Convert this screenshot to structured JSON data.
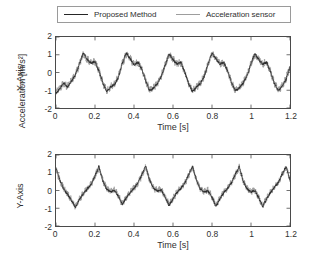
{
  "figure": {
    "outer_ylabel": "Acceleration [m/s²]",
    "legend": {
      "entries": [
        {
          "label": "Proposed Method",
          "color": "#262626",
          "style": "solid"
        },
        {
          "label": "Acceleration sensor",
          "color": "#9d9d9d",
          "style": "solid"
        }
      ]
    }
  },
  "chart_data": [
    {
      "type": "line",
      "title": "",
      "panel": "top",
      "xlabel": "Time [s]",
      "ylabel": "X-Axis",
      "xlim": [
        0,
        1.2
      ],
      "ylim": [
        -2,
        2
      ],
      "xticks": [
        0,
        0.2,
        0.4,
        0.6,
        0.8,
        1,
        1.2
      ],
      "xticklabels": [
        "0",
        "0.2",
        "0.4",
        "0.6",
        "0.8",
        "1",
        "1.2"
      ],
      "yticks": [
        -2,
        -1,
        0,
        1,
        2
      ],
      "yticklabels": [
        "-2",
        "-1",
        "0",
        "1",
        "2"
      ],
      "grid": false,
      "legend_position": "above-figure",
      "period": 0.222,
      "series": [
        {
          "name": "Acceleration sensor",
          "color": "#9d9d9d",
          "noise": 0.18,
          "x": [
            0,
            0.02,
            0.04,
            0.06,
            0.08,
            0.1,
            0.12,
            0.14,
            0.16,
            0.18,
            0.2,
            0.22,
            0.24,
            0.26,
            0.28,
            0.3,
            0.32,
            0.34,
            0.36,
            0.38,
            0.4,
            0.42,
            0.44,
            0.46,
            0.48,
            0.5,
            0.52,
            0.54,
            0.56,
            0.58,
            0.6,
            0.62,
            0.64,
            0.66,
            0.68,
            0.7,
            0.72,
            0.74,
            0.76,
            0.78,
            0.8,
            0.82,
            0.84,
            0.86,
            0.88,
            0.9,
            0.92,
            0.94,
            0.96,
            0.98,
            1.0,
            1.02,
            1.04,
            1.06,
            1.08,
            1.1,
            1.12,
            1.14,
            1.16,
            1.18,
            1.2
          ],
          "y": [
            -1.15,
            -0.85,
            -0.62,
            -0.8,
            -0.45,
            -0.1,
            0.45,
            1.05,
            0.75,
            0.55,
            0.6,
            0.1,
            -0.55,
            -1.05,
            -0.8,
            -0.65,
            -0.25,
            0.5,
            1.05,
            0.8,
            0.45,
            0.55,
            0.2,
            -0.45,
            -1.0,
            -0.85,
            -0.6,
            -0.2,
            0.4,
            1.0,
            0.75,
            0.5,
            0.55,
            0.05,
            -0.6,
            -1.05,
            -0.8,
            -0.6,
            -0.2,
            0.45,
            1.05,
            0.8,
            0.5,
            0.55,
            0.1,
            -0.55,
            -1.0,
            -0.85,
            -0.55,
            -0.15,
            0.5,
            1.0,
            0.75,
            0.5,
            0.55,
            0.05,
            -0.6,
            -1.0,
            -0.75,
            -0.35,
            0.3
          ]
        },
        {
          "name": "Proposed Method",
          "color": "#262626",
          "noise": 0.05,
          "x": [
            0,
            0.02,
            0.04,
            0.06,
            0.08,
            0.1,
            0.12,
            0.14,
            0.16,
            0.18,
            0.2,
            0.22,
            0.24,
            0.26,
            0.28,
            0.3,
            0.32,
            0.34,
            0.36,
            0.38,
            0.4,
            0.42,
            0.44,
            0.46,
            0.48,
            0.5,
            0.52,
            0.54,
            0.56,
            0.58,
            0.6,
            0.62,
            0.64,
            0.66,
            0.68,
            0.7,
            0.72,
            0.74,
            0.76,
            0.78,
            0.8,
            0.82,
            0.84,
            0.86,
            0.88,
            0.9,
            0.92,
            0.94,
            0.96,
            0.98,
            1.0,
            1.02,
            1.04,
            1.06,
            1.08,
            1.1,
            1.12,
            1.14,
            1.16,
            1.18,
            1.2
          ],
          "y": [
            -1.2,
            -0.88,
            -0.6,
            -0.82,
            -0.48,
            -0.12,
            0.48,
            1.1,
            0.72,
            0.52,
            0.62,
            0.08,
            -0.58,
            -1.08,
            -0.82,
            -0.68,
            -0.28,
            0.52,
            1.1,
            0.78,
            0.42,
            0.58,
            0.18,
            -0.48,
            -1.02,
            -0.88,
            -0.62,
            -0.22,
            0.42,
            1.05,
            0.72,
            0.48,
            0.58,
            0.02,
            -0.62,
            -1.08,
            -0.82,
            -0.62,
            -0.22,
            0.48,
            1.1,
            0.78,
            0.48,
            0.58,
            0.08,
            -0.58,
            -1.02,
            -0.88,
            -0.58,
            -0.18,
            0.52,
            1.05,
            0.72,
            0.48,
            0.58,
            0.02,
            -0.62,
            -1.02,
            -0.78,
            -0.38,
            0.32
          ]
        }
      ]
    },
    {
      "type": "line",
      "title": "",
      "panel": "bottom",
      "xlabel": "Time [s]",
      "ylabel": "Y-Axis",
      "xlim": [
        0,
        1.2
      ],
      "ylim": [
        -2,
        2
      ],
      "xticks": [
        0,
        0.2,
        0.4,
        0.6,
        0.8,
        1,
        1.2
      ],
      "xticklabels": [
        "0",
        "0.2",
        "0.4",
        "0.6",
        "0.8",
        "1",
        "1.2"
      ],
      "yticks": [
        -2,
        -1,
        0,
        1,
        2
      ],
      "yticklabels": [
        "-2",
        "-1",
        "0",
        "1",
        "2"
      ],
      "grid": false,
      "legend_position": "above-figure",
      "period": 0.215,
      "series": [
        {
          "name": "Acceleration sensor",
          "color": "#9d9d9d",
          "noise": 0.16,
          "x": [
            0,
            0.02,
            0.04,
            0.06,
            0.08,
            0.1,
            0.12,
            0.14,
            0.16,
            0.18,
            0.2,
            0.22,
            0.24,
            0.26,
            0.28,
            0.3,
            0.32,
            0.34,
            0.36,
            0.38,
            0.4,
            0.42,
            0.44,
            0.46,
            0.48,
            0.5,
            0.52,
            0.54,
            0.56,
            0.58,
            0.6,
            0.62,
            0.64,
            0.66,
            0.68,
            0.7,
            0.72,
            0.74,
            0.76,
            0.78,
            0.8,
            0.82,
            0.84,
            0.86,
            0.88,
            0.9,
            0.92,
            0.94,
            0.96,
            0.98,
            1.0,
            1.02,
            1.04,
            1.06,
            1.08,
            1.1,
            1.12,
            1.14,
            1.16,
            1.18,
            1.2
          ],
          "y": [
            1.2,
            0.55,
            0.1,
            -0.2,
            -0.55,
            -0.9,
            -0.5,
            -0.15,
            0.1,
            0.35,
            0.8,
            1.3,
            0.55,
            0.1,
            -0.05,
            0.05,
            -0.3,
            -0.75,
            -0.4,
            -0.1,
            0.15,
            0.4,
            0.85,
            1.35,
            0.6,
            0.15,
            0.0,
            0.05,
            -0.35,
            -0.8,
            -0.45,
            -0.1,
            0.15,
            0.4,
            0.85,
            1.3,
            0.6,
            0.1,
            -0.05,
            0.0,
            -0.35,
            -0.85,
            -0.45,
            -0.1,
            0.15,
            0.45,
            0.9,
            1.3,
            0.55,
            0.1,
            -0.05,
            0.0,
            -0.4,
            -0.85,
            -0.45,
            -0.1,
            0.2,
            0.45,
            0.9,
            1.3,
            0.6
          ]
        },
        {
          "name": "Proposed Method",
          "color": "#262626",
          "noise": 0.05,
          "x": [
            0,
            0.02,
            0.04,
            0.06,
            0.08,
            0.1,
            0.12,
            0.14,
            0.16,
            0.18,
            0.2,
            0.22,
            0.24,
            0.26,
            0.28,
            0.3,
            0.32,
            0.34,
            0.36,
            0.38,
            0.4,
            0.42,
            0.44,
            0.46,
            0.48,
            0.5,
            0.52,
            0.54,
            0.56,
            0.58,
            0.6,
            0.62,
            0.64,
            0.66,
            0.68,
            0.7,
            0.72,
            0.74,
            0.76,
            0.78,
            0.8,
            0.82,
            0.84,
            0.86,
            0.88,
            0.9,
            0.92,
            0.94,
            0.96,
            0.98,
            1.0,
            1.02,
            1.04,
            1.06,
            1.08,
            1.1,
            1.12,
            1.14,
            1.16,
            1.18,
            1.2
          ],
          "y": [
            1.25,
            0.58,
            0.08,
            -0.22,
            -0.58,
            -0.95,
            -0.52,
            -0.18,
            0.08,
            0.35,
            0.82,
            1.35,
            0.55,
            0.08,
            -0.08,
            0.02,
            -0.32,
            -0.8,
            -0.42,
            -0.12,
            0.12,
            0.42,
            0.88,
            1.4,
            0.58,
            0.12,
            -0.02,
            0.02,
            -0.38,
            -0.85,
            -0.48,
            -0.12,
            0.12,
            0.42,
            0.88,
            1.35,
            0.58,
            0.08,
            -0.08,
            -0.02,
            -0.38,
            -0.9,
            -0.48,
            -0.12,
            0.12,
            0.45,
            0.92,
            1.35,
            0.52,
            0.08,
            -0.08,
            -0.02,
            -0.42,
            -0.9,
            -0.48,
            -0.12,
            0.18,
            0.45,
            0.92,
            1.35,
            0.58
          ]
        }
      ]
    }
  ]
}
